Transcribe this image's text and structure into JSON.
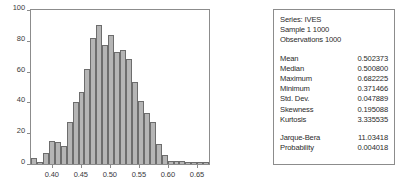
{
  "chart_data": {
    "type": "bar",
    "title": "",
    "subtitle": "",
    "xlabel": "",
    "ylabel": "",
    "grid": false,
    "legend": "none",
    "xlim": [
      0.3625,
      0.6725
    ],
    "ylim": [
      0,
      100
    ],
    "ytick_labels": [
      "0",
      "20",
      "40",
      "60",
      "80",
      "100"
    ],
    "ytick_values": [
      0,
      20,
      40,
      60,
      80,
      100
    ],
    "xtick_labels": [
      "0.40",
      "0.45",
      "0.50",
      "0.55",
      "0.60",
      "0.65"
    ],
    "xtick_values": [
      0.4,
      0.45,
      0.5,
      0.55,
      0.6,
      0.65
    ],
    "bin_width": 0.01,
    "bin_centers": [
      0.375,
      0.385,
      0.395,
      0.405,
      0.415,
      0.425,
      0.435,
      0.445,
      0.455,
      0.465,
      0.475,
      0.485,
      0.495,
      0.505,
      0.515,
      0.525,
      0.535,
      0.545,
      0.555,
      0.565,
      0.575,
      0.585,
      0.595,
      0.605,
      0.615,
      0.625,
      0.635,
      0.645,
      0.655,
      0.665
    ],
    "values": [
      4,
      1,
      7,
      15,
      14,
      12,
      27,
      40,
      47,
      62,
      82,
      90,
      77,
      84,
      73,
      74,
      68,
      53,
      41,
      33,
      27,
      13,
      6,
      2,
      2,
      2,
      1,
      1,
      1,
      1
    ],
    "categories": [
      "0.375",
      "0.385",
      "0.395",
      "0.405",
      "0.415",
      "0.425",
      "0.435",
      "0.445",
      "0.455",
      "0.465",
      "0.475",
      "0.485",
      "0.495",
      "0.505",
      "0.515",
      "0.525",
      "0.535",
      "0.545",
      "0.555",
      "0.565",
      "0.575",
      "0.585",
      "0.595",
      "0.605",
      "0.615",
      "0.625",
      "0.635",
      "0.645",
      "0.655",
      "0.665"
    ],
    "bar_color": "#b5b5b5",
    "bar_edge_color": "#6d6d6d"
  },
  "stats": {
    "series_label": "Series: IVES",
    "sample_label": "Sample 1 1000",
    "observations_label": "Observations 1000",
    "rows": [
      {
        "key": "Mean",
        "value": "0.502373"
      },
      {
        "key": "Median",
        "value": "0.500800"
      },
      {
        "key": "Maximum",
        "value": "0.682225"
      },
      {
        "key": "Minimum",
        "value": "0.371466"
      },
      {
        "key": "Std. Dev.",
        "value": "0.047889"
      },
      {
        "key": "Skewness",
        "value": "0.195088"
      },
      {
        "key": "Kurtosis",
        "value": "3.335535"
      }
    ],
    "test_rows": [
      {
        "key": "Jarque-Bera",
        "value": "11.03418"
      },
      {
        "key": "Probability",
        "value": "0.004018"
      }
    ]
  }
}
